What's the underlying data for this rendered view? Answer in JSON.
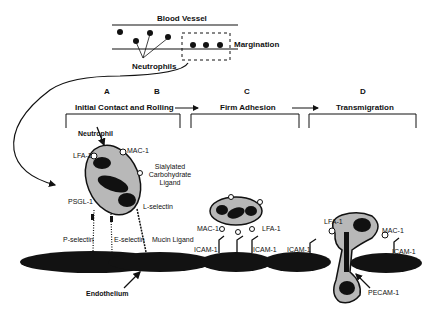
{
  "figure": {
    "top": {
      "title": "Blood Vessel",
      "neutrophils_label": "Neutrophils",
      "margination_label": "Margination"
    },
    "stages": [
      {
        "letter": "A",
        "title": ""
      },
      {
        "letter": "B",
        "title": "Initial Contact and Rolling"
      },
      {
        "letter": "C",
        "title": "Firm Adhesion"
      },
      {
        "letter": "D",
        "title": "Transmigration"
      }
    ],
    "stage_b_title": "Initial Contact and Rolling",
    "labels": {
      "neutrophil": "Neutrophil",
      "lfa1": "LFA-1",
      "mac1": "MAC-1",
      "sialylated_1": "Sialylated",
      "sialylated_2": "Carbohydrate",
      "sialylated_3": "Ligand",
      "psgl1": "PSGL-1",
      "lselectin": "L-selectin",
      "pselectin": "P-selectin",
      "eselectin": "E-selectin",
      "mucin": "Mucin Ligand",
      "endothelium": "Endothelium",
      "c_mac1": "MAC-1",
      "c_lfa1": "LFA-1",
      "c_icam1_a": "ICAM-1",
      "c_icam1_b": "ICAM-1",
      "c_icam1_c": "ICAM-1",
      "d_lfa1": "LFA-1",
      "d_mac1": "MAC-1",
      "d_icam1": "ICAM-1",
      "d_pecam1": "PECAM-1"
    },
    "colors": {
      "cell_fill": "#b8b8b8",
      "nucleus": "#111111",
      "endothelium": "#121212",
      "line": "#111111"
    }
  }
}
